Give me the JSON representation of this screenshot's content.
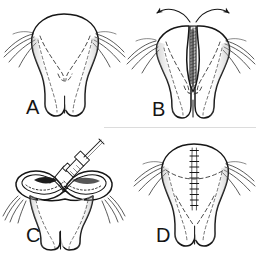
{
  "figure": {
    "background_color": "#ffffff",
    "ink_color": "#161616",
    "width": 258,
    "height": 255,
    "divider_color": "#d8d8d8",
    "panel_count": 4
  },
  "panels": [
    {
      "id": "A",
      "label": "A",
      "label_x": 26,
      "label_y": 114,
      "caption": "Intact structure, anterior view with dashed internal outline and lateral bristles",
      "position": "top-left",
      "features": [
        "dome-top",
        "dashed-internal-outline",
        "paired-lower-lobes",
        "lateral-appendages",
        "stipple-shading"
      ]
    },
    {
      "id": "B",
      "label": "B",
      "label_x": 152,
      "label_y": 116,
      "caption": "Structure opened at midline, curved arrows indicate outward retraction",
      "position": "top-right",
      "features": [
        "midline-split",
        "shaded-wedge",
        "two-curved-arrows",
        "dashed-internal-outline",
        "paired-lower-lobes",
        "lateral-appendages"
      ]
    },
    {
      "id": "C",
      "label": "C",
      "label_x": 26,
      "label_y": 242,
      "caption": "Oblique view with syringe needle injecting into the opened midline cavity",
      "position": "bottom-left",
      "features": [
        "oblique-view",
        "syringe",
        "needle",
        "plunger",
        "dark-cavity-opening",
        "stipple-shading",
        "lateral-appendages"
      ]
    },
    {
      "id": "D",
      "label": "D",
      "label_x": 156,
      "label_y": 242,
      "caption": "Closed structure with vertical midline suture line",
      "position": "bottom-right",
      "features": [
        "vertical-suture-line",
        "dashed-internal-outline",
        "paired-lower-lobes",
        "lateral-appendages",
        "transverse-dashed-line"
      ]
    }
  ],
  "annotations": {
    "arrows": {
      "count": 2,
      "direction": "outward-from-midline",
      "description": "Paired curved arrows above panel B pointing laterally outward"
    },
    "suture": {
      "description": "Running vertical midline suture with cross stitches",
      "stitch_count": 11
    },
    "syringe": {
      "description": "Hypodermic syringe with barrel, finger flange, plunger rod and needle",
      "needle_angle_deg": 55
    }
  }
}
